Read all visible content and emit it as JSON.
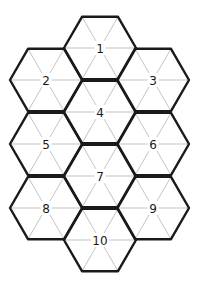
{
  "diagram": {
    "type": "hexagonal-grid",
    "line_color": "#1a1a1a",
    "spoke_color": "#b4b4b4",
    "hex_radius": 36,
    "hexes": [
      {
        "label": "1",
        "cx": 100,
        "cy": 48
      },
      {
        "label": "2",
        "cx": 46,
        "cy": 80
      },
      {
        "label": "3",
        "cx": 153,
        "cy": 80
      },
      {
        "label": "4",
        "cx": 100,
        "cy": 112
      },
      {
        "label": "5",
        "cx": 46,
        "cy": 144
      },
      {
        "label": "6",
        "cx": 153,
        "cy": 144
      },
      {
        "label": "7",
        "cx": 100,
        "cy": 176
      },
      {
        "label": "8",
        "cx": 46,
        "cy": 208
      },
      {
        "label": "9",
        "cx": 153,
        "cy": 208
      },
      {
        "label": "10",
        "cx": 100,
        "cy": 240
      }
    ]
  }
}
